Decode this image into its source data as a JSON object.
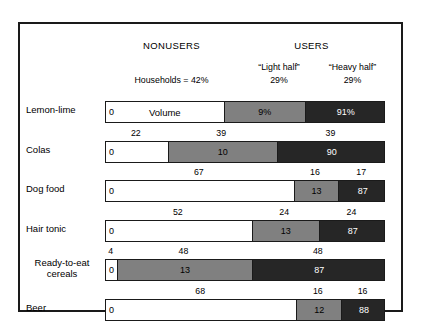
{
  "chart_data": {
    "type": "bar",
    "title": "",
    "subtitle": "",
    "orientation": "horizontal",
    "stacked": true,
    "xlabel": "",
    "ylabel": "",
    "xlim": [
      0,
      100
    ],
    "grid": false,
    "legend_position": "top",
    "group_headers": {
      "nonusers": "NONUSERS",
      "users": "USERS"
    },
    "sub_headers": {
      "light": "“Light half”",
      "heavy": "“Heavy half”"
    },
    "households_label": "Households = 42%",
    "households_light_pct": "29%",
    "households_heavy_pct": "29%",
    "volume_caption": "Volume",
    "series": [
      {
        "name": "Nonusers",
        "color": "#ffffff"
      },
      {
        "name": "“Light half”",
        "color": "#808080"
      },
      {
        "name": "“Heavy half”",
        "color": "#262626"
      }
    ],
    "categories": [
      "Lemon-lime",
      "Colas",
      "Dog food",
      "Hair tonic",
      "Ready-to-eat cereals",
      "Beer"
    ],
    "households_percent": {
      "note": "percent of households, shown above each bar",
      "values": [
        [
          42,
          29,
          29
        ],
        [
          22,
          39,
          39
        ],
        [
          67,
          16,
          17
        ],
        [
          52,
          24,
          24
        ],
        [
          4,
          48,
          48
        ],
        [
          68,
          16,
          16
        ]
      ]
    },
    "volume_percent": {
      "note": "percent of volume, shown inside each bar segment",
      "values": [
        [
          0,
          9,
          91
        ],
        [
          0,
          10,
          90
        ],
        [
          0,
          13,
          87
        ],
        [
          0,
          13,
          87
        ],
        [
          0,
          13,
          87
        ],
        [
          0,
          12,
          88
        ]
      ]
    }
  },
  "rows": [
    {
      "label": "Lemon-lime",
      "label_lines": [
        "Lemon-lime"
      ],
      "households": [
        42,
        29,
        29
      ],
      "households_labels": [
        "Households = 42%",
        "29%",
        "29%"
      ],
      "volume_labels": [
        "0",
        "9%",
        "91%"
      ],
      "caption": "Volume",
      "show_hh_row": false
    },
    {
      "label": "Colas",
      "label_lines": [
        "Colas"
      ],
      "households": [
        22,
        39,
        39
      ],
      "households_labels": [
        "22",
        "39",
        "39"
      ],
      "volume_labels": [
        "0",
        "10",
        "90"
      ],
      "caption": "",
      "show_hh_row": true
    },
    {
      "label": "Dog food",
      "label_lines": [
        "Dog food"
      ],
      "households": [
        67,
        16,
        17
      ],
      "households_labels": [
        "67",
        "16",
        "17"
      ],
      "volume_labels": [
        "0",
        "13",
        "87"
      ],
      "caption": "",
      "show_hh_row": true
    },
    {
      "label": "Hair tonic",
      "label_lines": [
        "Hair tonic"
      ],
      "households": [
        52,
        24,
        24
      ],
      "households_labels": [
        "52",
        "24",
        "24"
      ],
      "volume_labels": [
        "0",
        "13",
        "87"
      ],
      "caption": "",
      "show_hh_row": true
    },
    {
      "label": "Ready-to-eat cereals",
      "label_lines": [
        "Ready-to-eat",
        "cereals"
      ],
      "households": [
        4,
        48,
        48
      ],
      "households_labels": [
        "4",
        "48",
        "48"
      ],
      "volume_labels": [
        "0",
        "13",
        "87"
      ],
      "caption": "",
      "show_hh_row": true
    },
    {
      "label": "Beer",
      "label_lines": [
        "Beer"
      ],
      "households": [
        68,
        16,
        16
      ],
      "households_labels": [
        "68",
        "16",
        "16"
      ],
      "volume_labels": [
        "0",
        "12",
        "88"
      ],
      "caption": "",
      "show_hh_row": true
    }
  ],
  "colors": {
    "nonusers": "#ffffff",
    "light_half": "#808080",
    "heavy_half": "#262626",
    "border": "#1a1a1a",
    "text": "#000000"
  }
}
